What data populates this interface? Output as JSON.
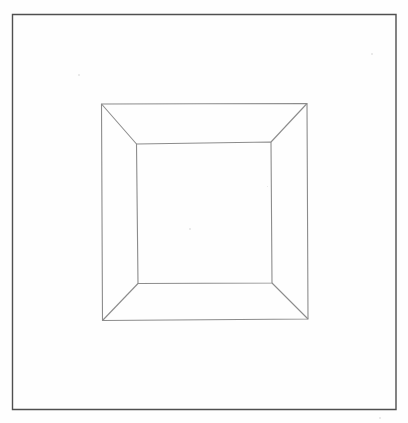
{
  "document": {
    "title": "Perspective Frame Line Drawing",
    "medium": "pencil-on-paper",
    "canvas": {
      "width": 408,
      "height": 423
    },
    "background_color": "#fefefe"
  },
  "styles": {
    "page_border_color": "#4f4f4f",
    "page_border_width": 1.4,
    "figure_line_color": "#8c8c8c",
    "figure_line_width": 1.1,
    "speck_color": "#cfcfcf"
  },
  "page_border": {
    "label": "page-border",
    "x1": 12.5,
    "y1": 14.5,
    "x2": 396.0,
    "y2": 409.5
  },
  "figure": {
    "label": "nested-square-perspective-frame",
    "outer_square": {
      "label": "outer-square",
      "points": "101.5,104 307,103.5 308,319 102.5,320.5"
    },
    "inner_square": {
      "label": "inner-square",
      "points": "136.5,144 271,142 272,283 138,283.5"
    },
    "diagonals": [
      {
        "label": "diagonal-top-left",
        "x1": 101.5,
        "y1": 104,
        "x2": 136.5,
        "y2": 144
      },
      {
        "label": "diagonal-top-right",
        "x1": 307.0,
        "y1": 103.5,
        "x2": 271.0,
        "y2": 142
      },
      {
        "label": "diagonal-bottom-right",
        "x1": 308.0,
        "y1": 319.0,
        "x2": 272.0,
        "y2": 283
      },
      {
        "label": "diagonal-bottom-left",
        "x1": 102.5,
        "y1": 320.5,
        "x2": 138.0,
        "y2": 283.5
      }
    ]
  },
  "specks": [
    {
      "label": "speck-upper-left",
      "x": 78,
      "y": 74,
      "size": 2
    },
    {
      "label": "speck-upper-right",
      "x": 371,
      "y": 53,
      "size": 2
    },
    {
      "label": "speck-center",
      "x": 189,
      "y": 228,
      "size": 2
    },
    {
      "label": "speck-right-mid",
      "x": 267,
      "y": 186,
      "size": 1
    },
    {
      "label": "speck-lower-right",
      "x": 379,
      "y": 417,
      "size": 2
    }
  ]
}
